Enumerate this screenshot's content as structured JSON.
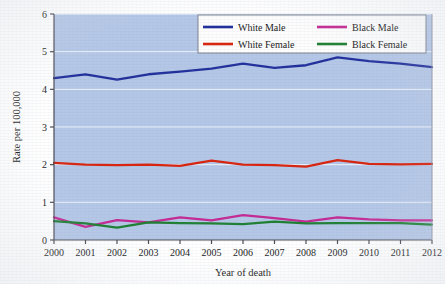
{
  "chart_data": {
    "type": "line",
    "title": "",
    "xlabel": "Year of death",
    "ylabel": "Rate per 100,000",
    "categories": [
      2000,
      2001,
      2002,
      2003,
      2004,
      2005,
      2006,
      2007,
      2008,
      2009,
      2010,
      2011,
      2012
    ],
    "x_tick_labels": [
      "2000",
      "2001",
      "2002",
      "2003",
      "2004",
      "2005",
      "2006",
      "2007",
      "2008",
      "2009",
      "2010",
      "2011",
      "2012"
    ],
    "y_tick_labels": [
      "0",
      "1",
      "2",
      "3",
      "4",
      "5",
      "6"
    ],
    "y_ticks": [
      0,
      1,
      2,
      3,
      4,
      5,
      6
    ],
    "ylim": [
      0,
      6
    ],
    "xlim": [
      2000,
      2012
    ],
    "grid": "horizontal-white",
    "legend_position": "top-center-right",
    "plot_background": "#b4c7e7",
    "series": [
      {
        "name": "White Male",
        "color": "#22309c",
        "values": [
          4.3,
          4.4,
          4.26,
          4.4,
          4.47,
          4.55,
          4.68,
          4.57,
          4.64,
          4.85,
          4.75,
          4.68,
          4.59
        ]
      },
      {
        "name": "White Female",
        "color": "#d8250f",
        "values": [
          2.05,
          2.0,
          1.99,
          2.0,
          1.97,
          2.11,
          2.0,
          1.99,
          1.95,
          2.12,
          2.02,
          2.01,
          2.02
        ]
      },
      {
        "name": "Black Male",
        "color": "#c42a93",
        "values": [
          0.6,
          0.35,
          0.53,
          0.47,
          0.6,
          0.52,
          0.66,
          0.58,
          0.49,
          0.6,
          0.55,
          0.52,
          0.52
        ]
      },
      {
        "name": "Black Female",
        "color": "#1f7f33",
        "values": [
          0.5,
          0.44,
          0.33,
          0.47,
          0.45,
          0.44,
          0.42,
          0.49,
          0.44,
          0.45,
          0.45,
          0.45,
          0.41
        ]
      }
    ]
  },
  "legend": {
    "entries": [
      {
        "label": "White Male",
        "color": "#22309c"
      },
      {
        "label": "Black Male",
        "color": "#c42a93"
      },
      {
        "label": "White Female",
        "color": "#d8250f"
      },
      {
        "label": "Black Female",
        "color": "#1f7f33"
      }
    ]
  },
  "axes": {
    "y_title": "Rate per 100,000",
    "x_title": "Year of death"
  }
}
